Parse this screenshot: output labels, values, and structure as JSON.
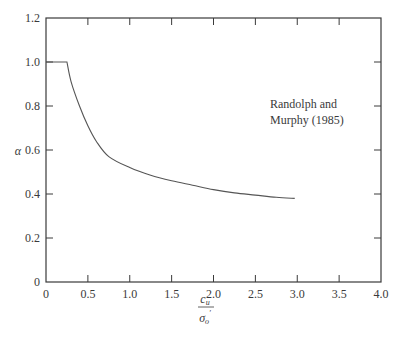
{
  "chart_data": {
    "type": "line",
    "title": "",
    "xlabel": "c_u / σ'_o",
    "xlabel_numerator": "c",
    "xlabel_numerator_sub": "u",
    "xlabel_denominator": "σ",
    "xlabel_denominator_sub": "o",
    "xlabel_denominator_prime": "′",
    "ylabel": "α",
    "xlim": [
      0,
      4.0
    ],
    "ylim": [
      0,
      1.2
    ],
    "xticks": [
      "0",
      "0.5",
      "1.0",
      "1.5",
      "2.0",
      "2.5",
      "3.0",
      "3.5",
      "4.0"
    ],
    "yticks": [
      "0",
      "0.2",
      "0.4",
      "0.6",
      "0.8",
      "1.0",
      "1.2"
    ],
    "grid": false,
    "legend": null,
    "annotations": [
      {
        "text_line1": "Randolph and",
        "text_line2": "Murphy (1985)",
        "x": 2.7,
        "y": 0.75
      }
    ],
    "series": [
      {
        "name": "Randolph and Murphy (1985)",
        "x": [
          0,
          0.25,
          0.3,
          0.4,
          0.5,
          0.6,
          0.75,
          1.0,
          1.25,
          1.5,
          1.75,
          2.0,
          2.25,
          2.5,
          2.75,
          2.97
        ],
        "values": [
          1.0,
          1.0,
          0.91,
          0.8,
          0.71,
          0.64,
          0.57,
          0.52,
          0.485,
          0.46,
          0.44,
          0.42,
          0.405,
          0.395,
          0.385,
          0.38
        ]
      }
    ]
  },
  "colors": {
    "axis": "#3a3a3a",
    "line": "#555555",
    "background": "#ffffff"
  }
}
